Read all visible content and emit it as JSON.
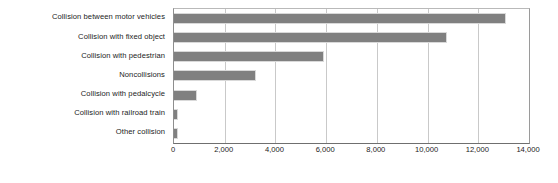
{
  "chart_data": {
    "type": "bar",
    "orientation": "horizontal",
    "title": "",
    "subtitle": "",
    "xlabel": "",
    "ylabel": "",
    "xlim": [
      0,
      14000
    ],
    "xticks": [
      0,
      2000,
      4000,
      6000,
      8000,
      10000,
      12000,
      14000
    ],
    "xtick_labels": [
      "0",
      "2,000",
      "4,000",
      "6,000",
      "8,000",
      "10,000",
      "12,000",
      "14,000"
    ],
    "grid": true,
    "grid_axis": "x",
    "legend": false,
    "legend_position": "none",
    "bar_color": "#808080",
    "categories": [
      "Collision between motor vehicles",
      "Collision with fixed object",
      "Collision with pedestrian",
      "Noncollisions",
      "Collision with pedalcycle",
      "Collision with railroad train",
      "Other collision"
    ],
    "values": [
      13100,
      10750,
      5900,
      3250,
      900,
      150,
      150
    ]
  },
  "colors": {
    "bar_fill": "#808080",
    "bar_outline": "#d9d9d9",
    "gridline": "#c9c9c9",
    "axis_line": "#6f6f6f",
    "plot_border": "#9a9a9a",
    "text": "#1b1b1b",
    "background": "#ffffff"
  }
}
